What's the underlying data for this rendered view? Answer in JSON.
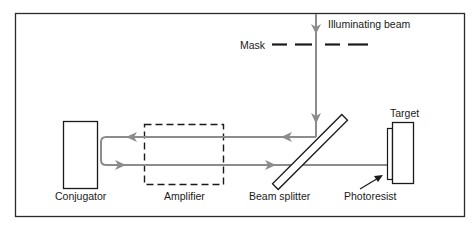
{
  "diagram": {
    "labels": {
      "illuminating_beam": "Illuminating beam",
      "mask": "Mask",
      "target": "Target",
      "conjugator": "Conjugator",
      "amplifier": "Amplifier",
      "beam_splitter": "Beam splitter",
      "photoresist": "Photoresist"
    },
    "colors": {
      "frame": "#2a2a2a",
      "beam": "#8c8c8c",
      "component": "#1a1a1a",
      "background": "#ffffff"
    }
  }
}
